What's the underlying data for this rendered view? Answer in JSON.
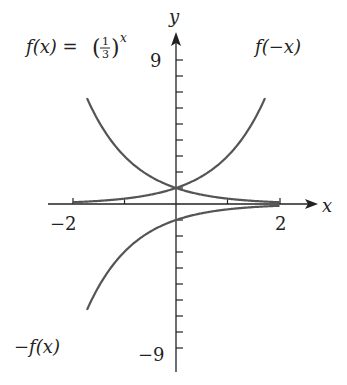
{
  "chart_data": {
    "type": "line",
    "title": "",
    "xlabel": "x",
    "ylabel": "y",
    "xlim": [
      -2,
      2
    ],
    "ylim": [
      -9,
      9
    ],
    "x_tick_labels": [
      "-2",
      "2"
    ],
    "y_tick_labels": [
      "9",
      "-9"
    ],
    "y_minor_ticks_step": 1,
    "x_minor_ticks_step": 1,
    "grid": false,
    "series": [
      {
        "name": "f(x) = (1/3)^x",
        "x": [
          -2,
          -1,
          0,
          1,
          2
        ],
        "values": [
          9,
          3,
          1,
          0.333,
          0.111
        ]
      },
      {
        "name": "f(-x)",
        "x": [
          -2,
          -1,
          0,
          1,
          2
        ],
        "values": [
          0.111,
          0.333,
          1,
          3,
          9
        ]
      },
      {
        "name": "-f(x)",
        "x": [
          -2,
          -1,
          0,
          1,
          2
        ],
        "values": [
          -9,
          -3,
          -1,
          -0.333,
          -0.111
        ]
      }
    ],
    "annotations": [
      "f(x) = (1/3)^x",
      "f(−x)",
      "−f(x)"
    ]
  },
  "labels": {
    "fx_prefix": "f(x) = ",
    "fx_frac_num": "1",
    "fx_frac_den": "3",
    "fx_exp": "x",
    "f_neg_x": "f(−x)",
    "neg_fx": "−f(x)",
    "x_axis": "x",
    "y_axis": "y",
    "x_min": "−2",
    "x_max": "2",
    "y_max": "9",
    "y_min": "−9"
  },
  "colors": {
    "curve": "#555555",
    "axis": "#222222"
  }
}
